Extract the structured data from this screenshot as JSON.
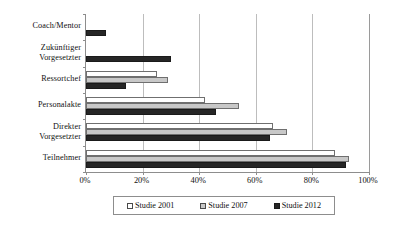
{
  "chart_data": {
    "type": "bar",
    "orientation": "horizontal",
    "title": "",
    "xlabel": "",
    "ylabel": "",
    "xlim": [
      0,
      100
    ],
    "xtick_labels": [
      "0%",
      "20%",
      "40%",
      "60%",
      "80%",
      "100%"
    ],
    "xtick_values": [
      0,
      20,
      40,
      60,
      80,
      100
    ],
    "grid": true,
    "legend_position": "bottom",
    "categories": [
      "Coach/Mentor",
      "Zukünftiger Vorgesetzter",
      "Ressortchef",
      "Personalakte",
      "Direkter Vorgesetzter",
      "Teilnehmer"
    ],
    "category_lines": [
      [
        "Coach/Mentor"
      ],
      [
        "Zukünftiger",
        "Vorgesetzter"
      ],
      [
        "Ressortchef"
      ],
      [
        "Personalakte"
      ],
      [
        "Direkter",
        "Vorgesetzter"
      ],
      [
        "Teilnehmer"
      ]
    ],
    "series": [
      {
        "name": "Studie 2001",
        "color": "#ffffff",
        "values": [
          null,
          null,
          25,
          42,
          66,
          88
        ]
      },
      {
        "name": "Studie 2007",
        "color": "#c8c8c8",
        "values": [
          null,
          null,
          29,
          54,
          71,
          93
        ]
      },
      {
        "name": "Studie 2012",
        "color": "#262626",
        "values": [
          7,
          30,
          14,
          46,
          65,
          92
        ]
      }
    ]
  },
  "legend": {
    "items": [
      {
        "label": "Studie 2001",
        "swatch": "white-square-swatch"
      },
      {
        "label": "Studie 2007",
        "swatch": "gray-square-swatch"
      },
      {
        "label": "Studie 2012",
        "swatch": "black-square-swatch"
      }
    ]
  },
  "colors": {
    "series_2001": "#ffffff",
    "series_2007": "#c8c8c8",
    "series_2012": "#262626",
    "axis": "#8d8d8d",
    "grid": "#bdbdbd",
    "text": "#111111",
    "background": "#ffffff"
  }
}
